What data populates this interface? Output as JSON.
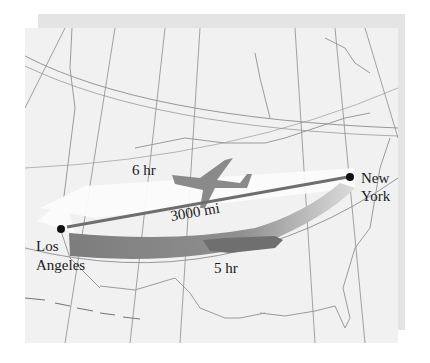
{
  "diagram": {
    "type": "map",
    "cities": [
      {
        "name": "Los Angeles",
        "label_line1": "Los",
        "label_line2": "Angeles"
      },
      {
        "name": "New York",
        "label_line1": "New",
        "label_line2": "York"
      }
    ],
    "distance_label": "3000 mi",
    "flights": [
      {
        "direction": "east-to-west",
        "label": "6 hr",
        "arrow_color": "#f6f6f6",
        "plane_color": "#8a8a8a"
      },
      {
        "direction": "west-to-east",
        "label": "5 hr",
        "arrow_color": "#8a8a8a",
        "plane_color": "#7a7a7a"
      }
    ],
    "colors": {
      "map_background": "#f1f1f1",
      "shadow": "#e4e4e4",
      "gridlines": "#8c8c8c",
      "coastlines": "#9a9a9a",
      "distance_line": "#6e6e6e",
      "text": "#1a1a1a"
    }
  }
}
